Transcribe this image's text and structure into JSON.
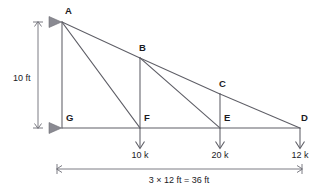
{
  "diagram": {
    "type": "structural-truss-free-body-diagram",
    "colors": {
      "member": "#5e5e66",
      "dimension": "#6e6e76",
      "text": "#1b1b1f",
      "support": "#8a8a92",
      "background": "#ffffff"
    },
    "nodes": [
      {
        "id": "A",
        "label": "A",
        "x": 62,
        "y": 22,
        "label_x": 65,
        "label_y": 14
      },
      {
        "id": "B",
        "label": "B",
        "x": 140,
        "y": 58,
        "label_x": 139,
        "label_y": 51
      },
      {
        "id": "C",
        "label": "C",
        "x": 220,
        "y": 94,
        "label_x": 219,
        "label_y": 87
      },
      {
        "id": "D",
        "label": "D",
        "x": 300,
        "y": 128,
        "label_x": 301,
        "label_y": 121
      },
      {
        "id": "E",
        "label": "E",
        "x": 220,
        "y": 128,
        "label_x": 224,
        "label_y": 121
      },
      {
        "id": "F",
        "label": "F",
        "x": 140,
        "y": 128,
        "label_x": 144,
        "label_y": 121
      },
      {
        "id": "G",
        "label": "G",
        "x": 62,
        "y": 128,
        "label_x": 66,
        "label_y": 121
      }
    ],
    "members": [
      {
        "from": "A",
        "to": "B",
        "kind": "top-chord"
      },
      {
        "from": "B",
        "to": "C",
        "kind": "top-chord"
      },
      {
        "from": "C",
        "to": "D",
        "kind": "top-chord"
      },
      {
        "from": "G",
        "to": "F",
        "kind": "bottom-chord"
      },
      {
        "from": "F",
        "to": "E",
        "kind": "bottom-chord"
      },
      {
        "from": "E",
        "to": "D",
        "kind": "bottom-chord"
      },
      {
        "from": "A",
        "to": "G",
        "kind": "vertical"
      },
      {
        "from": "B",
        "to": "F",
        "kind": "vertical"
      },
      {
        "from": "C",
        "to": "E",
        "kind": "vertical"
      },
      {
        "from": "A",
        "to": "F",
        "kind": "diagonal"
      },
      {
        "from": "B",
        "to": "E",
        "kind": "diagonal"
      }
    ],
    "supports": [
      {
        "at": "A",
        "marker": "pin-triangle",
        "x": 56,
        "y": 22
      },
      {
        "at": "G",
        "marker": "pin-triangle",
        "x": 56,
        "y": 128
      }
    ],
    "loads": [
      {
        "at": "F",
        "label": "10 k",
        "value": 10,
        "unit": "k",
        "x": 140,
        "label_x": 140,
        "label_y": 158,
        "direction": "down"
      },
      {
        "at": "E",
        "label": "20 k",
        "value": 20,
        "unit": "k",
        "x": 220,
        "label_x": 220,
        "label_y": 158,
        "direction": "down"
      },
      {
        "at": "D",
        "label": "12 k",
        "value": 12,
        "unit": "k",
        "x": 300,
        "label_x": 300,
        "label_y": 158,
        "direction": "down"
      }
    ],
    "dimensions": [
      {
        "id": "height",
        "label": "10 ft",
        "value": 10,
        "unit": "ft",
        "orientation": "vertical",
        "x": 38,
        "y1": 22,
        "y2": 128,
        "label_x": 13,
        "label_y": 81
      },
      {
        "id": "span",
        "label": "3 × 12 ft = 36 ft",
        "value": 36,
        "unit": "ft",
        "orientation": "horizontal",
        "y": 169,
        "x1": 57,
        "x2": 302,
        "label_x": 179,
        "label_y": 183
      }
    ]
  }
}
